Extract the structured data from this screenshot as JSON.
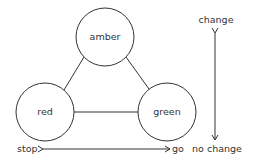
{
  "diagram": {
    "nodes": [
      {
        "id": "amber",
        "label": "amber",
        "cx": 105,
        "cy": 37,
        "r": 29
      },
      {
        "id": "red",
        "label": "red",
        "cx": 45,
        "cy": 112,
        "r": 29
      },
      {
        "id": "green",
        "label": "green",
        "cx": 167,
        "cy": 112,
        "r": 29
      }
    ],
    "edges": [
      {
        "from": "amber",
        "to": "red"
      },
      {
        "from": "amber",
        "to": "green"
      },
      {
        "from": "red",
        "to": "green"
      }
    ],
    "horizontal_axis": {
      "left_label": "stop",
      "right_label": "go"
    },
    "vertical_axis": {
      "top_label": "change",
      "bottom_label": "no change"
    },
    "colors": {
      "stroke": "#333333",
      "background": "#ffffff"
    }
  }
}
